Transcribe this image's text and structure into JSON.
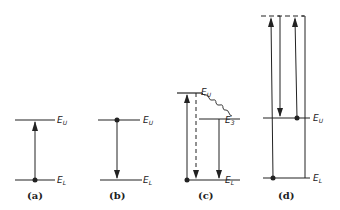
{
  "diagram": {
    "panels": [
      {
        "id": "a",
        "caption": "(a)",
        "upper_label": "E",
        "upper_sub": "U",
        "lower_label": "E",
        "lower_sub": "L",
        "process": "absorption"
      },
      {
        "id": "b",
        "caption": "(b)",
        "upper_label": "E",
        "upper_sub": "U",
        "lower_label": "E",
        "lower_sub": "L",
        "process": "emission"
      },
      {
        "id": "c",
        "caption": "(c)",
        "upper_label": "E",
        "upper_sub": "U",
        "mid_label": "E",
        "mid_sub": "3",
        "lower_label": "E",
        "lower_sub": "L",
        "process": "non-radiative decay then emission"
      },
      {
        "id": "d",
        "caption": "(d)",
        "upper_label": "E",
        "upper_sub": "U",
        "lower_label": "E",
        "lower_sub": "L",
        "process": "virtual level scattering"
      }
    ],
    "colors": {
      "line": "#222222",
      "background": "#ffffff"
    }
  }
}
